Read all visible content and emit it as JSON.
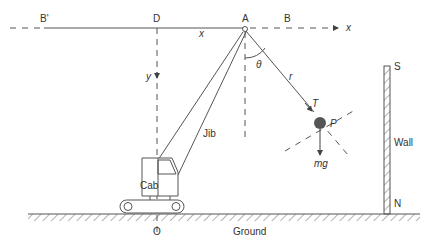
{
  "diagram": {
    "type": "crane-pendulum-physics",
    "labels": {
      "B_prime": "B'",
      "D": "D",
      "A": "A",
      "B": "B",
      "x_axis": "x",
      "x_dist": "x",
      "theta": "θ",
      "r": "r",
      "T": "T",
      "P": "P",
      "mg": "mg",
      "y": "y",
      "jib": "Jib",
      "cab": "Cab",
      "wall": "Wall",
      "S": "S",
      "N": "N",
      "O": "O",
      "ground": "Ground"
    },
    "colors": {
      "line": "#555555",
      "mass": "#555555",
      "text": "#333333"
    }
  }
}
